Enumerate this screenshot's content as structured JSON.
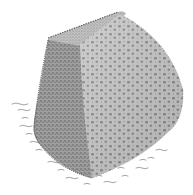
{
  "image": {
    "subject": "stippled illustration of a porous sponge-like block",
    "background": "#ffffff",
    "colors": {
      "dark_face": "#8a8a8a",
      "light_face": "#bdbdbd",
      "top_face": "#a9a9a9",
      "pore": "#6f6f6f",
      "ground_marks": "#8c8c8c"
    }
  }
}
